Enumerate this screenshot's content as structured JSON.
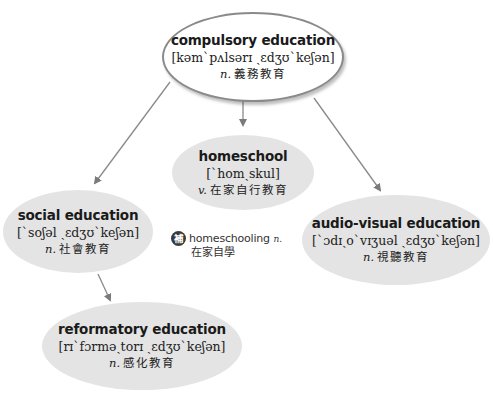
{
  "diagram": {
    "type": "concept-map",
    "root": {
      "id": "compulsory",
      "term": "compulsory education",
      "ipa": "[kəm`pʌlsərɪ ˏɛdʒʊ`keʃən]",
      "pos": "n.",
      "gloss": "義務教育"
    },
    "nodes": [
      {
        "id": "homeschool",
        "term": "homeschool",
        "ipa": "[`homˏskul]",
        "pos": "v.",
        "gloss": "在家自行教育"
      },
      {
        "id": "social",
        "term": "social education",
        "ipa": "[`soʃəl ˏɛdʒʊ`keʃən]",
        "pos": "n.",
        "gloss": "社會教育"
      },
      {
        "id": "audio-visual",
        "term": "audio-visual education",
        "ipa": "[`ɔdɪˏo`vɪʒuəl ˏɛdʒʊ`keʃən]",
        "pos": "n.",
        "gloss": "視聽教育"
      },
      {
        "id": "reformatory",
        "term": "reformatory education",
        "ipa": "[rɪ`fɔrməˏtorɪ ˏɛdʒʊ`keʃən]",
        "pos": "n.",
        "gloss": "感化教育"
      }
    ],
    "edges": [
      {
        "from": "compulsory",
        "to": "social"
      },
      {
        "from": "compulsory",
        "to": "homeschool"
      },
      {
        "from": "compulsory",
        "to": "audio-visual"
      },
      {
        "from": "social",
        "to": "reformatory"
      }
    ],
    "supplement": {
      "badge": "補",
      "word": "homeschooling",
      "pos": "n.",
      "gloss": "在家自學"
    },
    "colors": {
      "root_fill": "#ffffff",
      "root_border": "#8a8a8a",
      "child_fill": "#e4e4e4",
      "arrow": "#7a7a7a",
      "text": "#1a1a1a"
    }
  }
}
